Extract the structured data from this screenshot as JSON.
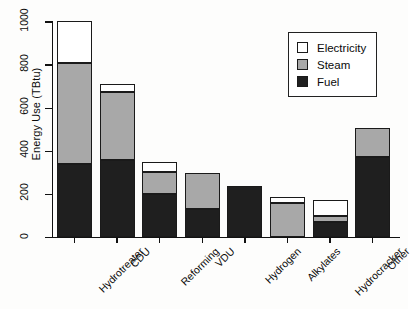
{
  "chart_data": {
    "type": "bar",
    "subtype": "stacked-bar",
    "title": "",
    "xlabel": "",
    "ylabel": "Energy Use (TBtu)",
    "ylim": [
      0,
      1000
    ],
    "yticks": [
      0,
      200,
      400,
      600,
      800,
      1000
    ],
    "ytick_labels": [
      "0",
      "200",
      "400",
      "600",
      "800",
      "1000"
    ],
    "grid": false,
    "legend_position": "top-right",
    "categories": [
      "Hydrotreater",
      "CDU",
      "Reforming",
      "VDU",
      "Hydrogen",
      "Alkylates",
      "Hydrocracker",
      "Other"
    ],
    "series": [
      {
        "name": "Fuel",
        "color": "#1f1f1f",
        "values": [
          340,
          358,
          200,
          130,
          240,
          0,
          70,
          372
        ]
      },
      {
        "name": "Steam",
        "color": "#a8a8a8",
        "values": [
          470,
          317,
          102,
          168,
          0,
          158,
          32,
          136
        ]
      },
      {
        "name": "Electricity",
        "color": "#ffffff",
        "values": [
          195,
          35,
          48,
          0,
          0,
          30,
          70,
          0
        ]
      }
    ],
    "totals": [
      1005,
      710,
      350,
      298,
      240,
      188,
      172,
      508
    ]
  },
  "legend": {
    "entries": [
      {
        "label": "Electricity",
        "swatch": "#ffffff"
      },
      {
        "label": "Steam",
        "swatch": "#a8a8a8"
      },
      {
        "label": "Fuel",
        "swatch": "#1f1f1f"
      }
    ]
  },
  "axes": {
    "y_title": "Energy Use (TBtu)"
  }
}
